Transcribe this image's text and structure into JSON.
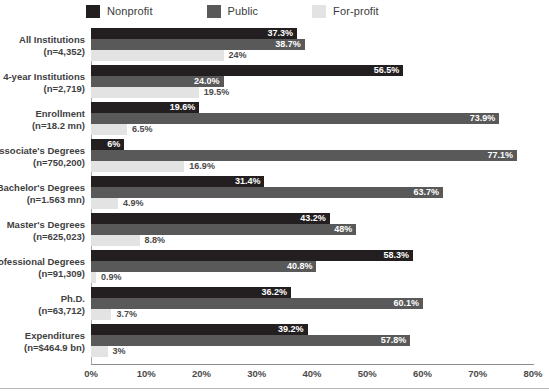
{
  "legend": {
    "items": [
      {
        "label": "Nonprofit",
        "color": "#231f20"
      },
      {
        "label": "Public",
        "color": "#595959"
      },
      {
        "label": "For-profit",
        "color": "#e3e3e3"
      }
    ]
  },
  "axis": {
    "x_ticks": [
      "0%",
      "10%",
      "20%",
      "30%",
      "40%",
      "50%",
      "60%",
      "70%",
      "80%"
    ],
    "x_min": 0,
    "x_max": 80
  },
  "chart_data": {
    "type": "bar",
    "orientation": "horizontal",
    "title": "",
    "xlabel": "",
    "ylabel": "",
    "xlim": [
      0,
      80
    ],
    "grid": false,
    "legend_position": "top",
    "categories": [
      "All Institutions",
      "4-year Institutions",
      "Enrollment",
      "Associate's Degrees",
      "Bachelor's Degrees",
      "Master's Degrees",
      "Professional Degrees",
      "Ph.D.",
      "Expenditures"
    ],
    "category_subtitles": [
      "(n=4,352)",
      "(n=2,719)",
      "(n=18.2 mn)",
      "(n=750,200)",
      "(n=1.563 mn)",
      "(n=625,023)",
      "(n=91,309)",
      "(n=63,712)",
      "(n=$464.9 bn)"
    ],
    "series": [
      {
        "name": "Nonprofit",
        "values": [
          37.3,
          56.5,
          19.6,
          6.0,
          31.4,
          43.2,
          58.3,
          36.2,
          39.2
        ]
      },
      {
        "name": "Public",
        "values": [
          38.7,
          24.0,
          73.9,
          77.1,
          63.7,
          48.0,
          40.8,
          60.1,
          57.8
        ]
      },
      {
        "name": "For-profit",
        "values": [
          24.0,
          19.5,
          6.5,
          16.9,
          4.9,
          8.8,
          0.9,
          3.7,
          3.0
        ]
      }
    ],
    "data_labels": [
      [
        "37.3%",
        "38.7%",
        "24%"
      ],
      [
        "56.5%",
        "24.0%",
        "19.5%"
      ],
      [
        "19.6%",
        "73.9%",
        "6.5%"
      ],
      [
        "6%",
        "77.1%",
        "16.9%"
      ],
      [
        "31.4%",
        "63.7%",
        "4.9%"
      ],
      [
        "43.2%",
        "48%",
        "8.8%"
      ],
      [
        "58.3%",
        "40.8%",
        "0.9%"
      ],
      [
        "36.2%",
        "60.1%",
        "3.7%"
      ],
      [
        "39.2%",
        "57.8%",
        "3%"
      ]
    ]
  }
}
